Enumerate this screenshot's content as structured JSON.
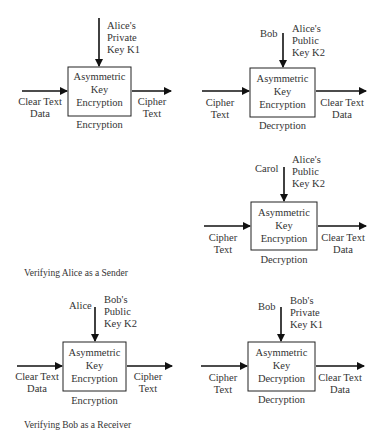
{
  "diagrams": [
    {
      "id": "d1",
      "box": [
        "Asymmetric",
        "Key",
        "Encryption"
      ],
      "below": "Encryption",
      "input": [
        "Clear Text",
        "Data"
      ],
      "output": [
        "Cipher",
        "Text"
      ],
      "actor": "",
      "key": [
        "Alice's",
        "Private",
        "Key K1"
      ]
    },
    {
      "id": "d2",
      "box": [
        "Asymmetric",
        "Key",
        "Encryption"
      ],
      "below": "Decryption",
      "input": [
        "Cipher",
        "Text"
      ],
      "output": [
        "Clear Text",
        "Data"
      ],
      "actor": "Bob",
      "key": [
        "Alice's",
        "Public",
        "Key K2"
      ]
    },
    {
      "id": "d3",
      "box": [
        "Asymmetric",
        "Key",
        "Encryption"
      ],
      "below": "Decryption",
      "input": [
        "Cipher",
        "Text"
      ],
      "output": [
        "Clear Text",
        "Data"
      ],
      "actor": "Carol",
      "key": [
        "Alice's",
        "Public",
        "Key K2"
      ]
    },
    {
      "id": "d4",
      "box": [
        "Asymmetric",
        "Key",
        "Encryption"
      ],
      "below": "Encryption",
      "input": [
        "Clear Text",
        "Data"
      ],
      "output": [
        "Cipher",
        "Text"
      ],
      "actor": "Alice",
      "key": [
        "Bob's",
        "Public",
        "Key K2"
      ]
    },
    {
      "id": "d5",
      "box": [
        "Asymmetric",
        "Key",
        "Decryption"
      ],
      "below": "Decryption",
      "input": [
        "Cipher",
        "Text"
      ],
      "output": [
        "Clear Text",
        "Data"
      ],
      "actor": "Bob",
      "key": [
        "Bob's",
        "Private",
        "Key K1"
      ]
    }
  ],
  "captions": {
    "sender": "Verifying Alice as a Sender",
    "receiver": "Verifying Bob as a Receiver"
  }
}
